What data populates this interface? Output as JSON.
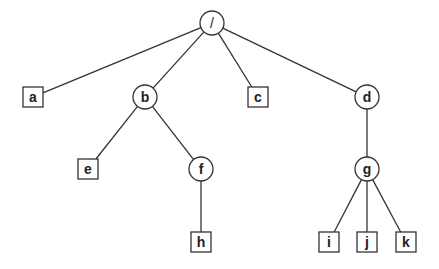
{
  "diagram": {
    "type": "tree",
    "nodes": [
      {
        "id": "root",
        "label": "/",
        "shape": "circle",
        "x": 212,
        "y": 23
      },
      {
        "id": "a",
        "label": "a",
        "shape": "square",
        "x": 33,
        "y": 97
      },
      {
        "id": "b",
        "label": "b",
        "shape": "circle",
        "x": 145,
        "y": 97
      },
      {
        "id": "c",
        "label": "c",
        "shape": "square",
        "x": 258,
        "y": 97
      },
      {
        "id": "d",
        "label": "d",
        "shape": "circle",
        "x": 367,
        "y": 97
      },
      {
        "id": "e",
        "label": "e",
        "shape": "square",
        "x": 88,
        "y": 169
      },
      {
        "id": "f",
        "label": "f",
        "shape": "circle",
        "x": 201,
        "y": 169
      },
      {
        "id": "g",
        "label": "g",
        "shape": "circle",
        "x": 367,
        "y": 169
      },
      {
        "id": "h",
        "label": "h",
        "shape": "square",
        "x": 201,
        "y": 242
      },
      {
        "id": "i",
        "label": "i",
        "shape": "square",
        "x": 329,
        "y": 242
      },
      {
        "id": "j",
        "label": "j",
        "shape": "square",
        "x": 367,
        "y": 242
      },
      {
        "id": "k",
        "label": "k",
        "shape": "square",
        "x": 406,
        "y": 242
      }
    ],
    "edges": [
      [
        "root",
        "a"
      ],
      [
        "root",
        "b"
      ],
      [
        "root",
        "c"
      ],
      [
        "root",
        "d"
      ],
      [
        "b",
        "e"
      ],
      [
        "b",
        "f"
      ],
      [
        "f",
        "h"
      ],
      [
        "d",
        "g"
      ],
      [
        "g",
        "i"
      ],
      [
        "g",
        "j"
      ],
      [
        "g",
        "k"
      ]
    ],
    "colors": {
      "stroke": "#333333",
      "fill": "#ffffff",
      "text": "#222222"
    }
  }
}
